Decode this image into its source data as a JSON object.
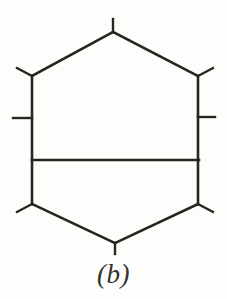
{
  "figure": {
    "caption": "(b)",
    "label_letter": "b",
    "diagram_type": "hexagonal-ring-skeletal-structure",
    "background_color": "#fdfdfb",
    "line_color": "#26251f",
    "canvas": {
      "width": 227,
      "height": 299
    }
  },
  "chart_data": {
    "type": "diagram",
    "title": "(b)",
    "units": "pixels",
    "vertices": [
      {
        "name": "top-apex",
        "x": 113,
        "y": 32
      },
      {
        "name": "upper-right",
        "x": 198,
        "y": 76
      },
      {
        "name": "lower-right",
        "x": 198,
        "y": 204
      },
      {
        "name": "bottom-apex",
        "x": 115,
        "y": 243
      },
      {
        "name": "lower-left",
        "x": 32,
        "y": 204
      },
      {
        "name": "upper-left",
        "x": 32,
        "y": 76
      }
    ],
    "edges": [
      {
        "name": "edge-top-left",
        "from": "upper-left",
        "to": "top-apex"
      },
      {
        "name": "edge-top-right",
        "from": "top-apex",
        "to": "upper-right"
      },
      {
        "name": "edge-right",
        "from": "upper-right",
        "to": "lower-right"
      },
      {
        "name": "edge-bottom-right",
        "from": "lower-right",
        "to": "bottom-apex"
      },
      {
        "name": "edge-bottom-left",
        "from": "bottom-apex",
        "to": "lower-left"
      },
      {
        "name": "edge-left",
        "from": "lower-left",
        "to": "upper-left"
      }
    ],
    "crossbar": {
      "name": "internal-horizontal-crossbar",
      "x1": 32,
      "y1": 160,
      "x2": 199,
      "y2": 160
    },
    "stubs": [
      {
        "name": "stub-top",
        "x1": 113,
        "y1": 32,
        "x2": 113,
        "y2": 19
      },
      {
        "name": "stub-upper-left",
        "x1": 32,
        "y1": 76,
        "x2": 17,
        "y2": 68
      },
      {
        "name": "stub-upper-right",
        "x1": 198,
        "y1": 76,
        "x2": 213,
        "y2": 68
      },
      {
        "name": "stub-mid-left",
        "x1": 32,
        "y1": 118,
        "x2": 13,
        "y2": 118
      },
      {
        "name": "stub-mid-right",
        "x1": 198,
        "y1": 117,
        "x2": 215,
        "y2": 117
      },
      {
        "name": "stub-lower-left",
        "x1": 32,
        "y1": 204,
        "x2": 17,
        "y2": 212
      },
      {
        "name": "stub-lower-right",
        "x1": 198,
        "y1": 204,
        "x2": 213,
        "y2": 212
      },
      {
        "name": "stub-bottom",
        "x1": 115,
        "y1": 243,
        "x2": 115,
        "y2": 254
      }
    ],
    "counts": {
      "vertices": 6,
      "ring_edges": 6,
      "internal_bars": 1,
      "external_stubs": 8
    }
  }
}
